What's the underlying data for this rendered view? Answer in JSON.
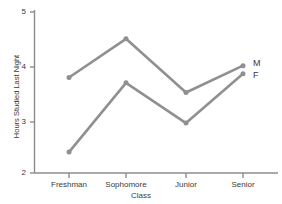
{
  "chart_data": {
    "type": "line",
    "title": "",
    "xlabel": "Class",
    "ylabel": "Hours Studied Last Night",
    "categories": [
      "Freshman",
      "Sophomore",
      "Junior",
      "Senior"
    ],
    "series": [
      {
        "name": "M",
        "values": [
          3.78,
          4.5,
          3.5,
          4.0
        ]
      },
      {
        "name": "F",
        "values": [
          2.39,
          3.68,
          2.93,
          3.85
        ]
      }
    ],
    "ylim": [
      2,
      5
    ],
    "yticks": [
      2,
      3,
      4,
      5
    ],
    "ytick_labels": [
      "2",
      "3",
      "4",
      "5"
    ],
    "grid": false,
    "legend_position": "right-inline",
    "line_color": "#909090",
    "axis_color": "#8c8c8c",
    "text_color": "#3a3a3a",
    "background": "#ffffff"
  },
  "axes": {
    "y_title": "Hours Studied Last Night",
    "x_title": "Class",
    "y_ticks": [
      {
        "label": "5"
      },
      {
        "label": "4"
      },
      {
        "label": "3"
      },
      {
        "label": "2"
      }
    ],
    "x_ticks": [
      {
        "label": "Freshman"
      },
      {
        "label": "Sophomore"
      },
      {
        "label": "Junior"
      },
      {
        "label": "Senior"
      }
    ]
  },
  "legend": {
    "male_label": "M",
    "female_label": "F"
  }
}
